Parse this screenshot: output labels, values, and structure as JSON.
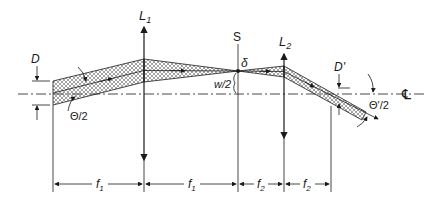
{
  "diagram": {
    "type": "optical beam path (two-lens relay / spatial filter)",
    "labels": {
      "lens1": "L",
      "lens1_sub": "1",
      "lens2": "L",
      "lens2_sub": "2",
      "stop": "S",
      "spot": "δ",
      "waist": "w/2",
      "diam_in": "D",
      "diam_out": "D'",
      "angle_in": "Θ/2",
      "angle_out": "Θ'/2",
      "centerline": "℄"
    },
    "dimensions": [
      {
        "label": "f",
        "sub": "1"
      },
      {
        "label": "f",
        "sub": "1"
      },
      {
        "label": "f",
        "sub": "2"
      },
      {
        "label": "f",
        "sub": "2"
      }
    ],
    "colors": {
      "ink": "#1a1a1a",
      "hatch": "#555555",
      "background": "#ffffff"
    }
  }
}
